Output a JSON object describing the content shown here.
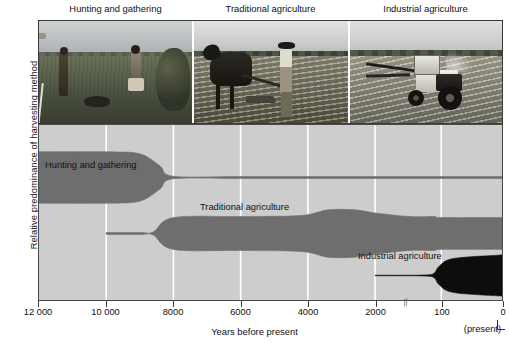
{
  "figure": {
    "y_axis_label": "Relative predominance of harvesting method",
    "x_axis_title": "Years before present",
    "present_note": "(present)"
  },
  "photos": [
    {
      "caption": "Hunting and gathering",
      "alt": "Two hunter-gatherers with bow walking through tall grass"
    },
    {
      "caption": "Traditional agriculture",
      "alt": "Farmer ploughing a field behind an ox"
    },
    {
      "caption": "Industrial agriculture",
      "alt": "Tractor with mower attachment in a cut field"
    }
  ],
  "x_ticks": [
    {
      "label": "12 000",
      "value": 12000
    },
    {
      "label": "10 000",
      "value": 10000
    },
    {
      "label": "8000",
      "value": 8000
    },
    {
      "label": "6000",
      "value": 6000
    },
    {
      "label": "4000",
      "value": 4000
    },
    {
      "label": "2000",
      "value": 2000
    },
    {
      "label": "100",
      "value": 100
    },
    {
      "label": "0",
      "value": 0
    }
  ],
  "axis_break": {
    "symbol": "//",
    "between": [
      2000,
      100
    ]
  },
  "band_labels": [
    {
      "text": "Hunting and gathering"
    },
    {
      "text": "Traditional agriculture"
    },
    {
      "text": "Industrial agriculture"
    }
  ],
  "colors": {
    "plot_background": "#cdcdcd",
    "gridline": "#ffffff",
    "band_gray": "#6e6e6e",
    "band_black": "#0d0d0d",
    "frame": "#4a4a4a",
    "text": "#111111"
  },
  "chart_data": {
    "type": "area",
    "title": "",
    "subtitle": "",
    "xlabel": "Years before present",
    "ylabel": "Relative predominance of harvesting method",
    "xlim": [
      12000,
      0
    ],
    "x_reversed": true,
    "axis_break_between": [
      2000,
      100
    ],
    "grid": "vertical white gridlines at each tick",
    "legend": "inline band labels",
    "note": "Widths are relative predominance (arbitrary units, 0-1 of band thickness).",
    "series": [
      {
        "name": "Hunting and gathering",
        "color": "#6e6e6e",
        "center_y": 0.3,
        "x": [
          12000,
          10000,
          9000,
          8400,
          8000,
          6000,
          4000,
          2000,
          100,
          0
        ],
        "width": [
          1.0,
          1.0,
          0.92,
          0.45,
          0.05,
          0.04,
          0.04,
          0.04,
          0.04,
          0.04
        ]
      },
      {
        "name": "Traditional agriculture",
        "color": "#6e6e6e",
        "center_y": 0.62,
        "x": [
          10000,
          9000,
          8600,
          8000,
          6000,
          4200,
          3400,
          2600,
          2000,
          1000,
          300,
          100,
          0
        ],
        "width": [
          0.04,
          0.04,
          0.06,
          0.62,
          0.66,
          0.7,
          0.92,
          0.92,
          0.8,
          0.66,
          0.66,
          0.62,
          0.62
        ]
      },
      {
        "name": "Industrial agriculture",
        "color": "#0d0d0d",
        "center_y": 0.86,
        "x": [
          2000,
          600,
          300,
          160,
          80,
          0
        ],
        "width": [
          0.01,
          0.02,
          0.1,
          0.36,
          0.66,
          0.8
        ]
      }
    ]
  }
}
